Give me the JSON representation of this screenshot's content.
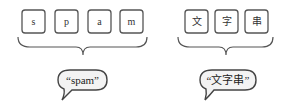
{
  "diagram": {
    "groups": [
      {
        "name": "latin",
        "characters": [
          "s",
          "p",
          "a",
          "m"
        ],
        "bubble_text": "“spam”"
      },
      {
        "name": "cjk",
        "characters": [
          "文",
          "字",
          "串"
        ],
        "bubble_text": "“文字串”"
      }
    ]
  }
}
